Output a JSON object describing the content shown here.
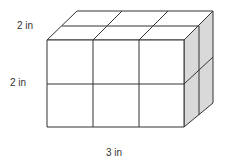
{
  "diagram": {
    "type": "rectangular-prism-of-unit-cubes",
    "labels": {
      "depth": "2 in",
      "height": "2 in",
      "width": "3 in"
    },
    "dimensions": {
      "width_cubes": 3,
      "height_cubes": 2,
      "depth_cubes": 2
    },
    "colors": {
      "stroke": "#333333",
      "front_face": "#ffffff",
      "top_face": "#ffffff",
      "side_face": "#d9d9d9"
    }
  }
}
